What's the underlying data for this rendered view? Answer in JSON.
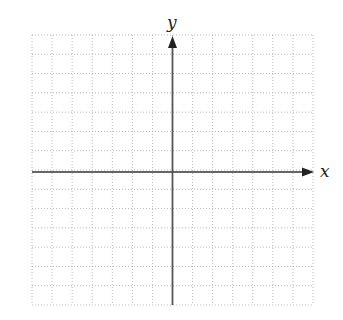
{
  "diagram": {
    "type": "coordinate-plane",
    "title": "",
    "grid": {
      "columns": 14,
      "rows": 14,
      "style": "dotted",
      "line_color": "#b8b8b8",
      "left": 32,
      "top": 35,
      "right": 313,
      "bottom": 305
    },
    "axes": {
      "color": "#333333",
      "origin_px": [
        172,
        172
      ],
      "x": {
        "label": "x",
        "arrow": "right"
      },
      "y": {
        "label": "y",
        "arrow": "up"
      }
    }
  },
  "chart_data": {
    "type": "scatter",
    "title": "",
    "xlabel": "x",
    "ylabel": "y",
    "series": [],
    "grid": true,
    "grid_cells": {
      "x": 14,
      "y": 14
    },
    "axis_ticks_labeled": false,
    "xlim": [
      -7,
      7
    ],
    "ylim": [
      -7,
      7
    ],
    "legend": null
  }
}
